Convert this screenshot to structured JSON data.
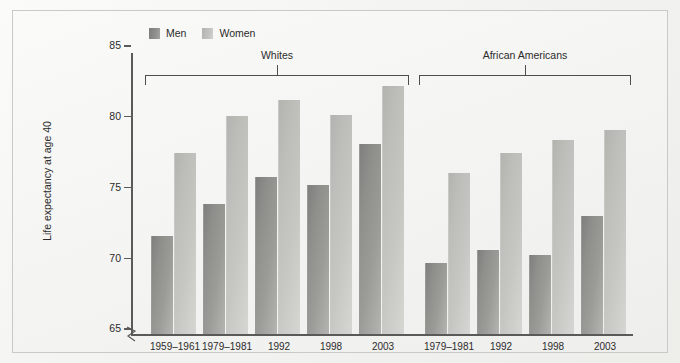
{
  "chart_data": {
    "type": "bar",
    "title": "",
    "xlabel": "",
    "ylabel": "Life expectancy at age 40",
    "ylim": [
      65,
      86
    ],
    "yticks": [
      65,
      70,
      75,
      80,
      85
    ],
    "grid": false,
    "legend_position": "top-left",
    "legend": [
      "Men",
      "Women"
    ],
    "axis_break": true,
    "groups": [
      {
        "name": "Whites",
        "categories": [
          "1959–1961",
          "1979–1981",
          "1992",
          "1998",
          "2003"
        ],
        "series": [
          {
            "name": "Men",
            "values": [
              71.5,
              73.8,
              75.7,
              75.1,
              78.0
            ]
          },
          {
            "name": "Women",
            "values": [
              77.4,
              80.0,
              81.1,
              80.1,
              82.1
            ]
          }
        ]
      },
      {
        "name": "African Americans",
        "categories": [
          "1979–1981",
          "1992",
          "1998",
          "2003"
        ],
        "series": [
          {
            "name": "Men",
            "values": [
              69.6,
              70.5,
              70.2,
              72.9
            ]
          },
          {
            "name": "Women",
            "values": [
              76.0,
              77.4,
              78.3,
              79.0
            ]
          }
        ]
      }
    ],
    "colors": {
      "men": "#8e8e8b",
      "women": "#c2c2be",
      "axis": "#5a5a58",
      "text": "#2b2b2b",
      "frame": "#c9c9c6",
      "background": "#f4f4f2"
    }
  }
}
